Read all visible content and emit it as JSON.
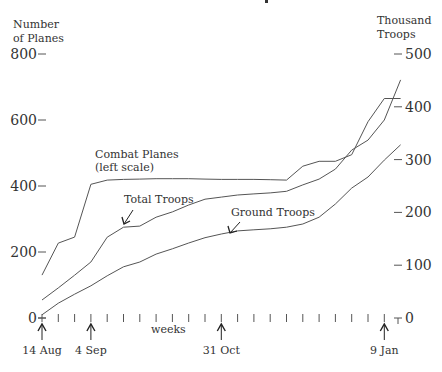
{
  "chart_data": {
    "type": "line",
    "title": "",
    "xlabel": "weeks",
    "ylabel_left": [
      "Number",
      "of Planes"
    ],
    "ylabel_right": [
      "Thousand",
      "Troops"
    ],
    "x": [
      0,
      1,
      2,
      3,
      4,
      5,
      6,
      7,
      8,
      9,
      10,
      11,
      12,
      13,
      14,
      15,
      16,
      17,
      18,
      19,
      20,
      21,
      22
    ],
    "xlim": [
      0,
      22
    ],
    "ylim_left": [
      0,
      800
    ],
    "ylim_right": [
      0,
      500
    ],
    "yticks_left": [
      0,
      200,
      400,
      600,
      800
    ],
    "yticks_right": [
      0,
      100,
      200,
      300,
      400,
      500
    ],
    "date_markers": [
      {
        "week": 0,
        "label": "14 Aug"
      },
      {
        "week": 3,
        "label": "4 Sep"
      },
      {
        "week": 11,
        "label": "31 Oct"
      },
      {
        "week": 21,
        "label": "9 Jan"
      }
    ],
    "series": [
      {
        "name": "Combat Planes",
        "axis": "left",
        "label": [
          "Combat Planes",
          "(left scale)"
        ],
        "values": [
          130,
          227,
          245,
          405,
          418,
          420,
          421,
          422,
          422,
          422,
          421,
          420,
          420,
          420,
          419,
          418,
          460,
          475,
          475,
          495,
          595,
          665,
          665
        ]
      },
      {
        "name": "Total Troops",
        "axis": "right",
        "label": [
          "Total Troops"
        ],
        "values": [
          34,
          57,
          81,
          106,
          153,
          172,
          174,
          191,
          201,
          214,
          225,
          229,
          233,
          235,
          237,
          240,
          252,
          263,
          282,
          318,
          337,
          375,
          451
        ]
      },
      {
        "name": "Ground Troops",
        "axis": "right",
        "label": [
          "Ground Troops"
        ],
        "values": [
          6,
          28,
          45,
          61,
          80,
          97,
          106,
          121,
          131,
          142,
          152,
          159,
          165,
          167,
          169,
          172,
          178,
          191,
          216,
          246,
          267,
          299,
          328
        ]
      }
    ],
    "grid": false,
    "legend": "none (inline labels with arrows)"
  }
}
